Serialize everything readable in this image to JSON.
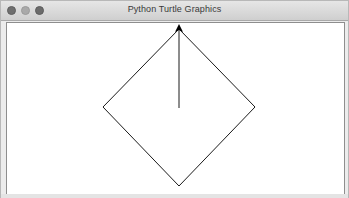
{
  "window": {
    "title": "Python Turtle Graphics",
    "traffic_lights": [
      "close-button",
      "minimize-button",
      "maximize-button"
    ]
  },
  "canvas": {
    "background": "#ffffff",
    "pen_color": "#000000",
    "shape": "diamond",
    "diamond_points": [
      [
        178,
        28
      ],
      [
        254,
        106
      ],
      [
        178,
        185
      ],
      [
        102,
        106
      ]
    ],
    "vertical_line": [
      [
        178,
        28
      ],
      [
        178,
        107
      ]
    ],
    "turtle": {
      "shape": "arrow",
      "heading": "up",
      "position": [
        178,
        28
      ]
    }
  }
}
